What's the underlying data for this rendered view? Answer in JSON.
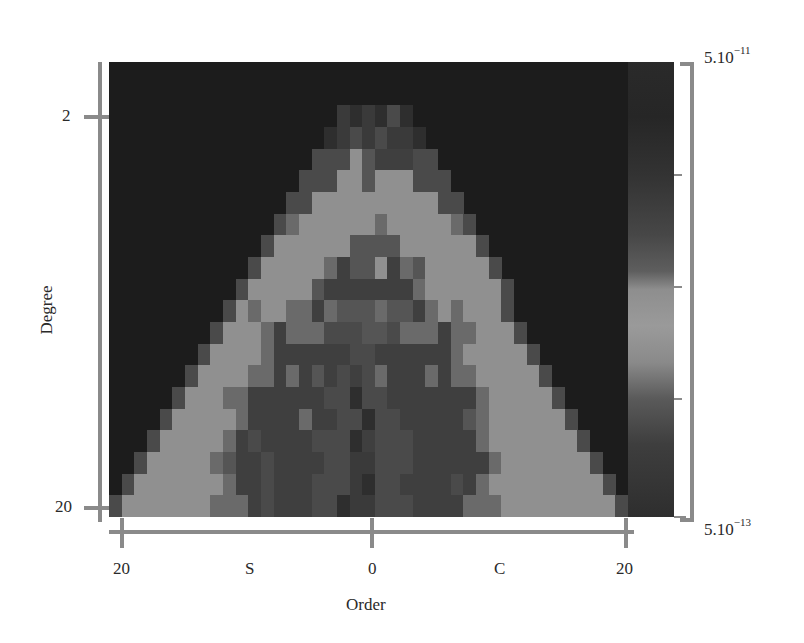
{
  "chart_data": {
    "type": "heatmap",
    "title": "",
    "xlabel": "Order",
    "ylabel": "Degree",
    "x_tick_labels": [
      "20",
      "S",
      "0",
      "C",
      "20"
    ],
    "y_tick_labels": [
      "2",
      "20"
    ],
    "x_range": [
      -20,
      20
    ],
    "y_range": [
      0,
      20
    ],
    "y_inverted": true,
    "x_note": "Left half S (sine) coefficients orders 20..1, right half C (cosine) coefficients orders 0..20",
    "colorbar": {
      "max_label": "5.10",
      "max_exp": "−11",
      "min_label": "5.10",
      "min_exp": "−13",
      "scale": "log",
      "range": [
        5e-13,
        5e-11
      ]
    },
    "value_scale_note": "cells encoded as gray levels 0 (dark/background) to 9 (lightest)",
    "rows": [
      "00000000000000000000000000000000000000000",
      "00000000000000000000000000000000000000000",
      "00000000000000000021213100000000000000000",
      "00000000000000000123232210000000000000000",
      "00000000000000003337544433000000000000000",
      "00000000000000033377577733300000000000000",
      "00000000000000337777777777330000000000000",
      "00000000000003677777767777763000000000000",
      "00000000000037777775555777777300000000000",
      "00000000000377777645574657777730000000000",
      "00000000003777775444444467777773000000000",
      "00000000037677664655565546767773000000000",
      "00000000377764666333553666466777300000000",
      "00000003777764444443344444467777730000000",
      "00000037777664645434364446466777773000000",
      "00000377766444444331334444444677777300000",
      "00003777776444464433133444445677777730000",
      "00037777764344443331433344444677777773000",
      "00377777654434444332233344444467777777300",
      "03777777764434443332133444434677777777730",
      "37777777666434443312233344446667777777773"
    ]
  },
  "axes": {
    "y_ticks": [
      {
        "label": "2",
        "top": 106
      },
      {
        "label": "20",
        "top": 495
      }
    ],
    "x_ticks": [
      {
        "label": "20",
        "left": 113
      },
      {
        "label": "S",
        "left": 245
      },
      {
        "label": "0",
        "left": 368
      },
      {
        "label": "C",
        "left": 494
      },
      {
        "label": "20",
        "left": 616
      }
    ],
    "x_title": "Order",
    "y_title": "Degree"
  }
}
